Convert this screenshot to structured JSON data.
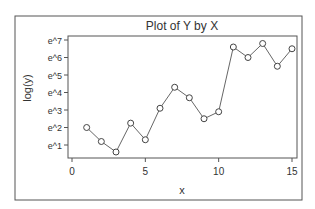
{
  "chart_data": {
    "type": "line",
    "title": "Plot of Y by X",
    "xlabel": "x",
    "ylabel": "log(y)",
    "x": [
      1,
      2,
      3,
      4,
      5,
      6,
      7,
      8,
      9,
      10,
      11,
      12,
      13,
      14,
      15
    ],
    "series": [
      {
        "name": "log(y)",
        "values": [
          2.0,
          1.2,
          0.6,
          2.25,
          1.3,
          3.1,
          4.3,
          3.7,
          2.5,
          2.9,
          6.6,
          6.0,
          6.8,
          5.5,
          6.5
        ],
        "marker": "open-circle",
        "color": "#555555"
      }
    ],
    "xticks": [
      0,
      5,
      10,
      15
    ],
    "xtick_labels": [
      "0",
      "5",
      "10",
      "15"
    ],
    "yticks": [
      1,
      2,
      3,
      4,
      5,
      6,
      7
    ],
    "ytick_labels": [
      "e^1",
      "e^2",
      "e^3",
      "e^4",
      "e^5",
      "e^6",
      "e^7"
    ],
    "xlim": [
      -0.3,
      15.3
    ],
    "ylim": [
      0.3,
      7.2
    ],
    "grid": false,
    "legend": "none"
  }
}
